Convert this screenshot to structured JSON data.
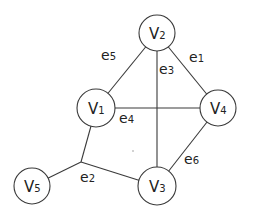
{
  "diagram": {
    "type": "hypergraph",
    "colors": {
      "stroke": "#3a3a3a",
      "text": "#222222",
      "background": "#ffffff"
    },
    "nodes": [
      {
        "id": "V1",
        "base": "V",
        "sub": "1"
      },
      {
        "id": "V2",
        "base": "V",
        "sub": "2"
      },
      {
        "id": "V3",
        "base": "V",
        "sub": "3"
      },
      {
        "id": "V4",
        "base": "V",
        "sub": "4"
      },
      {
        "id": "V5",
        "base": "V",
        "sub": "5"
      }
    ],
    "edges": [
      {
        "id": "e1",
        "base": "e",
        "sub": "1",
        "connects": [
          "V2",
          "V4"
        ]
      },
      {
        "id": "e2",
        "base": "e",
        "sub": "2",
        "connects": [
          "V1",
          "V5",
          "V3"
        ],
        "hyperedge": true
      },
      {
        "id": "e3",
        "base": "e",
        "sub": "3",
        "connects": [
          "V2",
          "V3"
        ]
      },
      {
        "id": "e4",
        "base": "e",
        "sub": "4",
        "connects": [
          "V1",
          "V4"
        ]
      },
      {
        "id": "e5",
        "base": "e",
        "sub": "5",
        "connects": [
          "V2",
          "V1"
        ]
      },
      {
        "id": "e6",
        "base": "e",
        "sub": "6",
        "connects": [
          "V4",
          "V3"
        ]
      }
    ]
  }
}
